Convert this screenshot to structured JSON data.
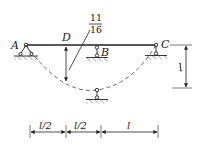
{
  "diagram": {
    "type": "structural-beam",
    "points": {
      "A": "A",
      "B": "B",
      "C": "C",
      "D": "D"
    },
    "fraction": {
      "numerator": "11",
      "denominator": "16"
    },
    "dimensions": {
      "bottom": [
        "l/2",
        "l/2",
        "l"
      ],
      "right": "l"
    },
    "colors": {
      "line": "#222222",
      "dashed": "#555555",
      "background": "#ffffff"
    }
  }
}
